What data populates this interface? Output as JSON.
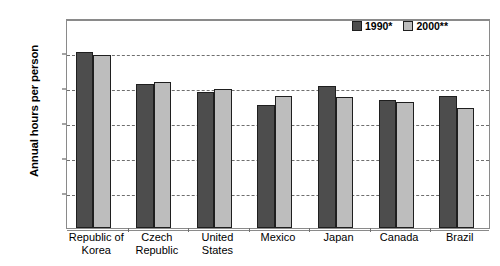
{
  "chart_data": {
    "type": "bar",
    "title": "",
    "xlabel": "",
    "ylabel": "Annual hours per person",
    "ylim": [
      0,
      3000
    ],
    "ytick_step": 500,
    "ytick_labels": [
      "0",
      "500",
      "1,000",
      "1,500",
      "2,000",
      "2,500",
      "3,000"
    ],
    "grid": true,
    "legend_position": "top-right",
    "categories": [
      "Republic of\nKorea",
      "Czech\nRepublic",
      "United\nStates",
      "Mexico",
      "Japan",
      "Canada",
      "Brazil"
    ],
    "category_lines": [
      [
        "Republic of",
        "Korea"
      ],
      [
        "Czech",
        "Republic"
      ],
      [
        "United",
        "States"
      ],
      [
        "Mexico"
      ],
      [
        "Japan"
      ],
      [
        "Canada"
      ],
      [
        "Brazil"
      ]
    ],
    "series": [
      {
        "name": "1990*",
        "color": "#4d4d4d",
        "values": [
          2520,
          2060,
          1950,
          1755,
          2030,
          1835,
          1880
        ]
      },
      {
        "name": "2000**",
        "color": "#bdbdbd",
        "values": [
          2470,
          2090,
          1980,
          1890,
          1870,
          1800,
          1710
        ]
      }
    ]
  },
  "legend": {
    "items": [
      {
        "label": "1990*",
        "swatch": "s1990"
      },
      {
        "label": "2000**",
        "swatch": "s2000"
      }
    ]
  },
  "axes": {
    "y_title": "Annual hours per person"
  },
  "header": {
    "clipped_title": ""
  }
}
